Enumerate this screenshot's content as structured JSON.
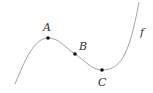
{
  "diagram": {
    "curve_label": "f",
    "points": [
      {
        "label": "A",
        "x": 48,
        "y": 38
      },
      {
        "label": "B",
        "x": 75,
        "y": 54
      },
      {
        "label": "C",
        "x": 102,
        "y": 70
      }
    ],
    "colors": {
      "curve": "#999999",
      "point": "#111111",
      "label": "#333333"
    }
  }
}
